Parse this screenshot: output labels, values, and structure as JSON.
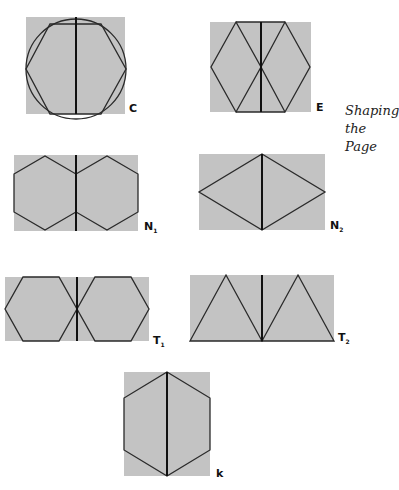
{
  "side_title": {
    "lines": [
      "Shaping",
      "the",
      "Page"
    ]
  },
  "figures": [
    {
      "id": "C",
      "label": "C",
      "subscript": ""
    },
    {
      "id": "E",
      "label": "E",
      "subscript": ""
    },
    {
      "id": "N1",
      "label": "N",
      "subscript": "1"
    },
    {
      "id": "N2",
      "label": "N",
      "subscript": "2"
    },
    {
      "id": "T1",
      "label": "T",
      "subscript": "1"
    },
    {
      "id": "T2",
      "label": "T",
      "subscript": "2"
    },
    {
      "id": "k",
      "label": "k",
      "subscript": ""
    }
  ],
  "colors": {
    "page_fill": "#c3c3c3",
    "line": "#2a2a2a",
    "background": "#ffffff"
  }
}
